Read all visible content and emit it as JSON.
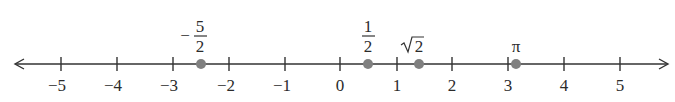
{
  "number_line": {
    "min_tick": -5,
    "max_tick": 5,
    "tick_labels": [
      "−5",
      "−4",
      "−3",
      "−2",
      "−1",
      "0",
      "1",
      "2",
      "3",
      "4",
      "5"
    ],
    "line_color": "#333333",
    "point_color": "#808080",
    "points": [
      {
        "value": -2.5,
        "label_sign": "−",
        "label_num": "5",
        "label_den": "2",
        "label_text": "−5/2"
      },
      {
        "value": 0.5,
        "label_num": "1",
        "label_den": "2",
        "label_text": "1/2"
      },
      {
        "value": 1.4142,
        "label_text": "√2",
        "radicand": "2"
      },
      {
        "value": 3.1416,
        "label_text": "π"
      }
    ]
  }
}
